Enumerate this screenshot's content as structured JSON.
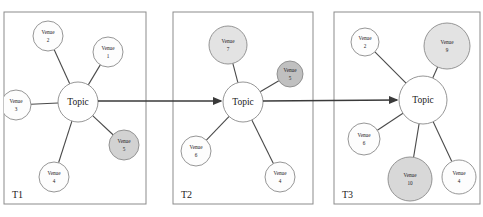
{
  "figure": {
    "width": 483,
    "height": 217,
    "background": "#ffffff"
  },
  "style": {
    "border_color": "#8b8b8b",
    "edge_color": "#4a4a4a",
    "arrow_color": "#3a3a3a",
    "node_stroke": "#8a8a8a",
    "fill_white": "#fdfdfd",
    "fill_light_gray": "#e3e3e3",
    "fill_mid_gray": "#d2d2d2",
    "fill_dark_gray": "#c0c0c0",
    "text_color": "#1c1c1c"
  },
  "chart_data": {
    "type": "diagram",
    "subtype": "ego-network-time-series",
    "center_label": "Topic",
    "panels": [
      {
        "id": "T1",
        "label": "T1",
        "box": {
          "x": 4,
          "y": 12,
          "w": 142,
          "h": 192
        },
        "label_pos": {
          "x": 12,
          "y": 198
        },
        "center": {
          "x": 78,
          "y": 102,
          "r": 20,
          "label": "Topic",
          "fill": "#ffffff"
        },
        "nodes": [
          {
            "id": "t1-v2",
            "label_line1": "Venue",
            "label_line2": "2",
            "x": 48,
            "y": 36,
            "r": 15,
            "fill": "#fdfdfd",
            "shaded": false
          },
          {
            "id": "t1-v1",
            "label_line1": "Venue",
            "label_line2": "1",
            "x": 108,
            "y": 52,
            "r": 15,
            "fill": "#fdfdfd",
            "shaded": false
          },
          {
            "id": "t1-v3",
            "label_line1": "Venue",
            "label_line2": "3",
            "x": 16,
            "y": 105,
            "r": 15,
            "fill": "#fdfdfd",
            "shaded": false
          },
          {
            "id": "t1-v4",
            "label_line1": "Venue",
            "label_line2": "4",
            "x": 54,
            "y": 177,
            "r": 15,
            "fill": "#fdfdfd",
            "shaded": false
          },
          {
            "id": "t1-v5",
            "label_line1": "Venue",
            "label_line2": "5",
            "x": 124,
            "y": 145,
            "r": 15,
            "fill": "#d2d2d2",
            "shaded": true
          }
        ]
      },
      {
        "id": "T2",
        "label": "T2",
        "box": {
          "x": 173,
          "y": 12,
          "w": 140,
          "h": 192
        },
        "label_pos": {
          "x": 181,
          "y": 198
        },
        "center": {
          "x": 243,
          "y": 102,
          "r": 20,
          "label": "Topic",
          "fill": "#ffffff"
        },
        "nodes": [
          {
            "id": "t2-v7",
            "label_line1": "Venue",
            "label_line2": "7",
            "x": 228,
            "y": 45,
            "r": 19,
            "fill": "#e3e3e3",
            "shaded": true
          },
          {
            "id": "t2-v5",
            "label_line1": "Venue",
            "label_line2": "5",
            "x": 290,
            "y": 74,
            "r": 13,
            "fill": "#c0c0c0",
            "shaded": true
          },
          {
            "id": "t2-v6",
            "label_line1": "Venue",
            "label_line2": "6",
            "x": 196,
            "y": 151,
            "r": 15,
            "fill": "#fdfdfd",
            "shaded": false
          },
          {
            "id": "t2-v4",
            "label_line1": "Venue",
            "label_line2": "4",
            "x": 280,
            "y": 177,
            "r": 15,
            "fill": "#fdfdfd",
            "shaded": false
          }
        ]
      },
      {
        "id": "T3",
        "label": "T3",
        "box": {
          "x": 334,
          "y": 12,
          "w": 146,
          "h": 192
        },
        "label_pos": {
          "x": 342,
          "y": 198
        },
        "center": {
          "x": 423,
          "y": 100,
          "r": 24,
          "label": "Topic",
          "fill": "#ffffff"
        },
        "nodes": [
          {
            "id": "t3-v2",
            "label_line1": "Venue",
            "label_line2": "2",
            "x": 365,
            "y": 42,
            "r": 14,
            "fill": "#fdfdfd",
            "shaded": false
          },
          {
            "id": "t3-v9",
            "label_line1": "Venue",
            "label_line2": "9",
            "x": 447,
            "y": 46,
            "r": 23,
            "fill": "#e3e3e3",
            "shaded": true
          },
          {
            "id": "t3-v6",
            "label_line1": "Venue",
            "label_line2": "6",
            "x": 364,
            "y": 139,
            "r": 16,
            "fill": "#fdfdfd",
            "shaded": false
          },
          {
            "id": "t3-v10",
            "label_line1": "Venue",
            "label_line2": "10",
            "x": 410,
            "y": 179,
            "r": 22,
            "fill": "#d8d8d8",
            "shaded": true
          },
          {
            "id": "t3-v4",
            "label_line1": "Venue",
            "label_line2": "4",
            "x": 459,
            "y": 177,
            "r": 17,
            "fill": "#fdfdfd",
            "shaded": false
          }
        ]
      }
    ],
    "flow_arrows": [
      {
        "id": "arrow-t1-t2",
        "from_panel": "T1",
        "to_panel": "T2",
        "x1": 98,
        "y1": 101,
        "x2": 221,
        "y2": 101
      },
      {
        "id": "arrow-t2-t3",
        "from_panel": "T2",
        "to_panel": "T3",
        "x1": 263,
        "y1": 101,
        "x2": 397,
        "y2": 100
      }
    ]
  }
}
